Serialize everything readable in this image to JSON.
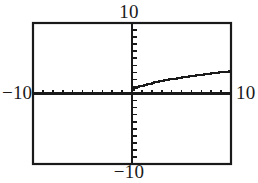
{
  "figure": {
    "title": "",
    "kind": "graphing-calculator-viewport",
    "background_color": "#ffffff",
    "ink_color": "#1a1a1a"
  },
  "labels": {
    "top": "10",
    "bottom": "−10",
    "left": "−10",
    "right": "10"
  },
  "chart_data": {
    "type": "line",
    "title": "",
    "xlabel": "",
    "ylabel": "",
    "xlim": [
      -10,
      10
    ],
    "ylim": [
      -10,
      10
    ],
    "xscl": 1,
    "yscl": 1,
    "grid": false,
    "legend": null,
    "axes": {
      "x_axis_y": 0,
      "y_axis_x": 0,
      "ticks_on_axes": true,
      "x_tick_count_per_side": 10,
      "y_tick_count_per_side": 10,
      "tick_length_px": 4,
      "border": true
    },
    "annotations": [
      {
        "text": "10",
        "position": "top"
      },
      {
        "text": "−10",
        "position": "bottom"
      },
      {
        "text": "−10",
        "position": "left"
      },
      {
        "text": "10",
        "position": "right"
      }
    ],
    "series": [
      {
        "name": "y = sqrt(x)",
        "domain": [
          0,
          10
        ],
        "x": [
          0,
          0.25,
          0.5,
          0.75,
          1,
          1.25,
          1.5,
          1.75,
          2,
          2.25,
          2.5,
          2.75,
          3,
          3.25,
          3.5,
          3.75,
          4,
          4.25,
          4.5,
          4.75,
          5,
          5.25,
          5.5,
          5.75,
          6,
          6.25,
          6.5,
          6.75,
          7,
          7.25,
          7.5,
          7.75,
          8,
          8.25,
          8.5,
          8.75,
          9,
          9.25,
          9.5,
          9.75,
          10
        ],
        "values": [
          0,
          0.5,
          0.71,
          0.87,
          1,
          1.12,
          1.22,
          1.32,
          1.41,
          1.5,
          1.58,
          1.66,
          1.73,
          1.8,
          1.87,
          1.94,
          2,
          2.06,
          2.12,
          2.18,
          2.24,
          2.29,
          2.35,
          2.4,
          2.45,
          2.5,
          2.55,
          2.6,
          2.65,
          2.69,
          2.74,
          2.78,
          2.83,
          2.87,
          2.92,
          2.96,
          3,
          3.04,
          3.08,
          3.12,
          3.16
        ]
      }
    ]
  }
}
